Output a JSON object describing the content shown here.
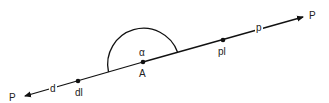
{
  "diagram": {
    "labels": {
      "left_end": "P",
      "left_segment": "d",
      "left_point": "dl",
      "center_point": "A",
      "angle": "α",
      "right_point": "pl",
      "right_segment": "p",
      "right_end": "P"
    },
    "colors": {
      "stroke": "#111111",
      "text": "#222222",
      "background": "#ffffff"
    }
  }
}
